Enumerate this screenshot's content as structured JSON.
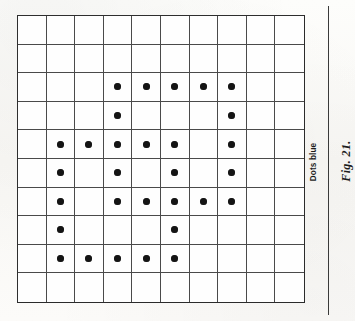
{
  "figure": {
    "caption": "Fig. 21.",
    "note": "Dots blue"
  },
  "colors": {
    "dot": "#141414",
    "grid_line": "#4a4a4a",
    "grid_border": "#2e2e2e",
    "rule": "#3a3a3a",
    "paper": "#fbfbf9"
  },
  "chart_data": {
    "type": "heatmap",
    "title": "Fig. 21.",
    "xlabel": "",
    "ylabel": "",
    "rows": 10,
    "columns": 10,
    "legend": [
      "Dots blue"
    ],
    "dot_rows": [
      [
        false,
        false,
        false,
        false,
        false,
        false,
        false,
        false,
        false,
        false
      ],
      [
        false,
        false,
        false,
        false,
        false,
        false,
        false,
        false,
        false,
        false
      ],
      [
        false,
        false,
        false,
        true,
        true,
        true,
        true,
        true,
        false,
        false
      ],
      [
        false,
        false,
        false,
        true,
        false,
        false,
        false,
        true,
        false,
        false
      ],
      [
        false,
        true,
        true,
        true,
        true,
        true,
        false,
        true,
        false,
        false
      ],
      [
        false,
        true,
        false,
        true,
        false,
        true,
        false,
        true,
        false,
        false
      ],
      [
        false,
        true,
        false,
        true,
        true,
        true,
        true,
        true,
        false,
        false
      ],
      [
        false,
        true,
        false,
        false,
        false,
        true,
        false,
        false,
        false,
        false
      ],
      [
        false,
        true,
        true,
        true,
        true,
        true,
        false,
        false,
        false,
        false
      ],
      [
        false,
        false,
        false,
        false,
        false,
        false,
        false,
        false,
        false,
        false
      ]
    ],
    "dot_coordinates": [
      {
        "row": 3,
        "col": 4
      },
      {
        "row": 3,
        "col": 5
      },
      {
        "row": 3,
        "col": 6
      },
      {
        "row": 3,
        "col": 7
      },
      {
        "row": 3,
        "col": 8
      },
      {
        "row": 4,
        "col": 4
      },
      {
        "row": 4,
        "col": 8
      },
      {
        "row": 5,
        "col": 2
      },
      {
        "row": 5,
        "col": 3
      },
      {
        "row": 5,
        "col": 4
      },
      {
        "row": 5,
        "col": 5
      },
      {
        "row": 5,
        "col": 6
      },
      {
        "row": 5,
        "col": 8
      },
      {
        "row": 6,
        "col": 2
      },
      {
        "row": 6,
        "col": 4
      },
      {
        "row": 6,
        "col": 6
      },
      {
        "row": 6,
        "col": 8
      },
      {
        "row": 7,
        "col": 2
      },
      {
        "row": 7,
        "col": 4
      },
      {
        "row": 7,
        "col": 5
      },
      {
        "row": 7,
        "col": 6
      },
      {
        "row": 7,
        "col": 7
      },
      {
        "row": 7,
        "col": 8
      },
      {
        "row": 8,
        "col": 2
      },
      {
        "row": 8,
        "col": 6
      },
      {
        "row": 9,
        "col": 2
      },
      {
        "row": 9,
        "col": 3
      },
      {
        "row": 9,
        "col": 4
      },
      {
        "row": 9,
        "col": 5
      },
      {
        "row": 9,
        "col": 6
      }
    ],
    "dots_per_row": [
      0,
      0,
      5,
      2,
      6,
      4,
      6,
      2,
      5,
      0
    ],
    "total_dots": 30
  }
}
